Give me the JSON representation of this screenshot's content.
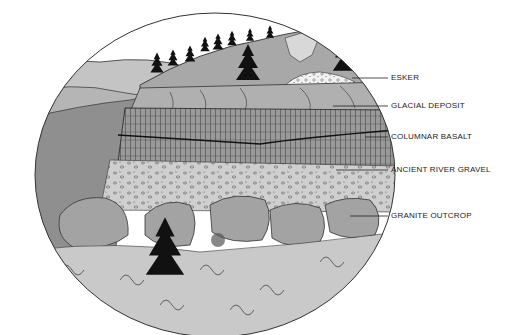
{
  "diagram": {
    "type": "geologic cross-section illustration",
    "colors": {
      "sky": "#ffffff",
      "river": "#8f8f8f",
      "hill": "#a8a8a8",
      "distant_hills": "#c4c4c4",
      "basalt": "#9a9a9a",
      "gravel": "#cfcfcf",
      "granite": "#a3a3a3",
      "foreground": "#c9c9c9",
      "trees": "#111111",
      "outline": "#333333"
    },
    "labels": [
      {
        "id": "esker",
        "text": "ESKER",
        "x": 391,
        "y": 73,
        "leader_from_x": 352,
        "leader_y": 78
      },
      {
        "id": "glacial-deposit",
        "text": "GLACIAL DEPOSIT",
        "x": 391,
        "y": 101,
        "leader_from_x": 333,
        "leader_y": 106
      },
      {
        "id": "columnar-basalt",
        "text": "COLUMNAR BASALT",
        "x": 391,
        "y": 132,
        "leader_from_x": 365,
        "leader_y": 137
      },
      {
        "id": "ancient-river-gravel",
        "text": "ANCIENT RIVER GRAVEL",
        "x": 391,
        "y": 165,
        "leader_from_x": 336,
        "leader_y": 170
      },
      {
        "id": "granite-outcrop",
        "text": "GRANITE OUTCROP",
        "x": 391,
        "y": 211,
        "leader_from_x": 350,
        "leader_y": 216
      }
    ]
  }
}
